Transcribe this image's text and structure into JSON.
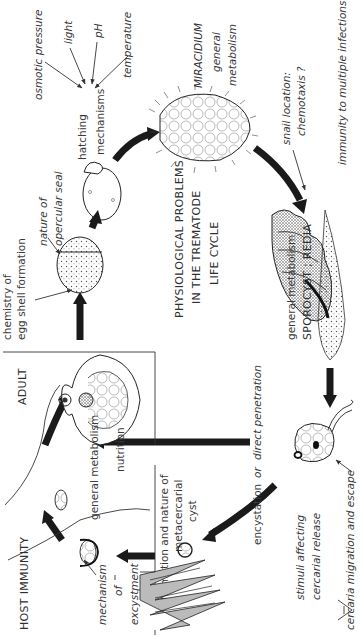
{
  "title": {
    "line1": "PHYSIOLOGICAL PROBLEMS",
    "line2": "IN THE  TREMATODE",
    "line3": "LIFE CYCLE"
  },
  "stages": {
    "miracidium": {
      "name": "MIRACIDIUM",
      "sub1": "general",
      "sub2": "metabolism"
    },
    "sporocyst": {
      "line1": "general metabolism",
      "line2": "SPOROCYST ; REDIA"
    },
    "adult": {
      "name": "ADULT",
      "sub1": "general metabolism",
      "sub2": "nutrition"
    },
    "host": {
      "name": "HOST IMMUNITY"
    }
  },
  "labels": {
    "osmotic": "osmotic pressure",
    "light": "light",
    "ph": "pH",
    "temperature": "temperature",
    "hatching1": "hatching",
    "hatching2": "mechanisms",
    "opercular1": "nature of",
    "opercular2": "opercular seal",
    "eggshell1": "chemistry of",
    "eggshell2": "egg shell formation",
    "snail1": "snail location:",
    "snail2": "chemotaxis ?",
    "immunity": "immunity to multiple infections ?",
    "cercaria_migration": "cercaria migration and escape",
    "stimuli1": "stimuli affecting",
    "stimuli2": "cercarial release",
    "encystation": "encystation",
    "or": "or",
    "direct": "direct penetration",
    "meta1": "formation and nature of",
    "meta2": "metacercarial",
    "meta3": "cyst",
    "excyst1": "mechanism",
    "excyst2": "of",
    "excyst3": "excystment"
  },
  "colors": {
    "ink": "#1a1a1a",
    "text": "#3a3a3a",
    "background": "#ffffff"
  }
}
